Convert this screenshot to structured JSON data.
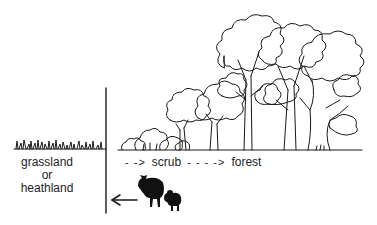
{
  "diagram": {
    "left_zone": {
      "label_lines": [
        "grassland",
        "or",
        "heathland"
      ]
    },
    "succession": {
      "stages": [
        {
          "arrow": "- ->",
          "label": "scrub"
        },
        {
          "arrow": "- - - ->",
          "label": "forest"
        }
      ]
    },
    "grazers": {
      "animals": [
        "cow",
        "sheep"
      ],
      "arrow_direction": "left"
    },
    "colors": {
      "ink": "#1a1a1a",
      "background": "#ffffff"
    }
  }
}
